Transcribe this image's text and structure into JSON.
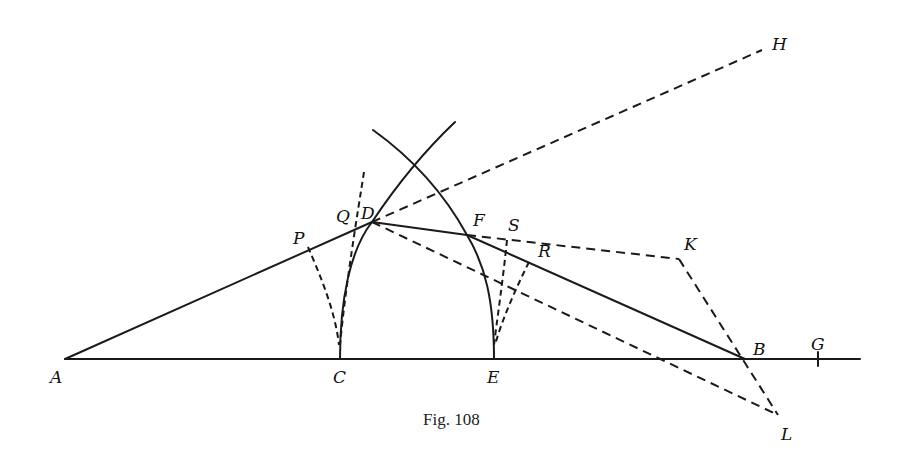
{
  "figure": {
    "caption": "Fig. 108",
    "background": "#ffffff",
    "ink_color": "#1a1a1a"
  },
  "points": {
    "A": {
      "label": "A",
      "x": 65,
      "y": 359
    },
    "C": {
      "label": "C",
      "x": 340,
      "y": 359
    },
    "E": {
      "label": "E",
      "x": 494,
      "y": 359
    },
    "B": {
      "label": "B",
      "x": 745,
      "y": 359
    },
    "G": {
      "label": "G",
      "x": 818,
      "y": 359
    },
    "D": {
      "label": "D",
      "x": 372,
      "y": 222
    },
    "F": {
      "label": "F",
      "x": 467,
      "y": 235
    },
    "P": {
      "label": "P",
      "x": 308,
      "y": 247
    },
    "Q": {
      "label": "Q",
      "x": 353,
      "y": 228
    },
    "S": {
      "label": "S",
      "x": 507,
      "y": 240
    },
    "R": {
      "label": "R",
      "x": 529,
      "y": 262
    },
    "K": {
      "label": "K",
      "x": 679,
      "y": 259
    },
    "L": {
      "label": "L",
      "x": 781,
      "y": 417
    },
    "H": {
      "label": "H",
      "x": 764,
      "y": 45
    }
  },
  "segments": {
    "solid": [
      "A-B-G (baseline)",
      "A-D",
      "D-F",
      "F-B"
    ],
    "dashed": [
      "D-H",
      "D-L",
      "F-K",
      "K-L",
      "P-C",
      "Q-C",
      "S-E",
      "R-E"
    ],
    "arcs": [
      "arc centered near E through C and D",
      "arc centered near C through E and F"
    ]
  }
}
